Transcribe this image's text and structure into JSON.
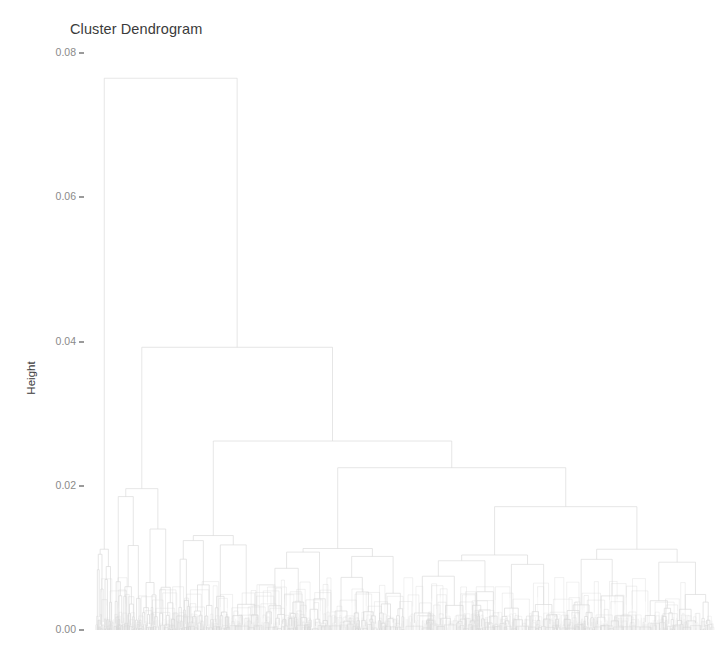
{
  "chart_data": {
    "type": "dendrogram",
    "title": "Cluster Dendrogram",
    "xlabel": "",
    "ylabel": "Height",
    "ylim": [
      0.0,
      0.0825
    ],
    "grid": false,
    "legend": null,
    "y_ticks": [
      {
        "value": "0.08",
        "num": 0.08
      },
      {
        "value": "0.06",
        "num": 0.06
      },
      {
        "value": "0.04",
        "num": 0.04
      },
      {
        "value": "0.02",
        "num": 0.02
      },
      {
        "value": "0.00",
        "num": 0.0
      }
    ],
    "x_tick_labels": [],
    "line_color": "#d9d9d9",
    "text_color": "#3b3b3b",
    "tick_color": "#8a8a8a",
    "background": "#ffffff",
    "n_leaves": 420,
    "merges": [
      {
        "id": "root",
        "height": 0.0765,
        "left_x": 100,
        "right_x": 184
      },
      {
        "id": "n2",
        "height": 0.0392,
        "left_x": 127,
        "right_x": 240
      },
      {
        "id": "n3",
        "height": 0.0262,
        "left_x": 155,
        "right_x": 330
      },
      {
        "id": "n4",
        "height": 0.0225,
        "left_x": 204,
        "right_x": 440
      },
      {
        "id": "n5",
        "height": 0.0171,
        "left_x": 300,
        "right_x": 580
      },
      {
        "id": "n6",
        "height": 0.0185,
        "left_x": 150,
        "right_x": 163
      },
      {
        "id": "n7",
        "height": 0.0124,
        "left_x": 192,
        "right_x": 215
      },
      {
        "id": "n8",
        "height": 0.0105,
        "left_x": 99,
        "right_x": 106
      },
      {
        "id": "n9",
        "height": 0.0108,
        "left_x": 271,
        "right_x": 330
      },
      {
        "id": "n10",
        "height": 0.0096,
        "left_x": 512,
        "right_x": 640
      },
      {
        "id": "n11",
        "height": 0.0089,
        "left_x": 352,
        "right_x": 392
      },
      {
        "id": "n12",
        "height": 0.008,
        "left_x": 600,
        "right_x": 680
      },
      {
        "id": "n13",
        "height": 0.0072,
        "left_x": 286,
        "right_x": 311
      },
      {
        "id": "n14",
        "height": 0.0066,
        "left_x": 430,
        "right_x": 472
      },
      {
        "id": "n15",
        "height": 0.0058,
        "left_x": 560,
        "right_x": 606
      }
    ]
  },
  "axis": {
    "y_title": "Height"
  },
  "title": {
    "text": "Cluster Dendrogram"
  }
}
